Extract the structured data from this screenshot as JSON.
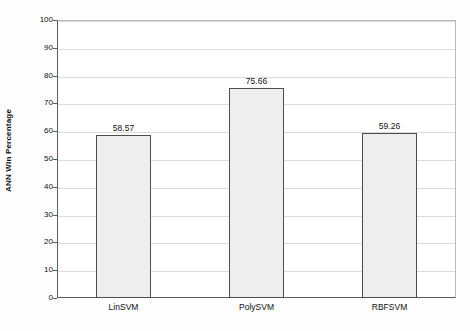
{
  "chart_data": {
    "type": "bar",
    "title": "",
    "subtitle": "",
    "xlabel": "",
    "ylabel": "ANN Win Percentage",
    "categories": [
      "LinSVM",
      "PolySVM",
      "RBFSVM"
    ],
    "values": [
      58.57,
      75.66,
      59.26
    ],
    "value_labels": [
      "58.57",
      "75.66",
      "59.26"
    ],
    "ylim": [
      0,
      100
    ],
    "ytick_step": 10,
    "yticks": [
      0,
      10,
      20,
      30,
      40,
      50,
      60,
      70,
      80,
      90,
      100
    ],
    "ytick_labels": [
      "0",
      "10",
      "20",
      "30",
      "40",
      "50",
      "60",
      "70",
      "80",
      "90",
      "100"
    ],
    "grid": true,
    "grid_axis": "y",
    "legend": false,
    "legend_position": "none",
    "bar_fill_color": "#eeeeee",
    "bar_border_color": "#4d4d4d",
    "gridline_color": "#dcdcdc",
    "axis_color": "#5a5a5a",
    "background_color": "#ffffff",
    "data_labels_visible": true
  }
}
